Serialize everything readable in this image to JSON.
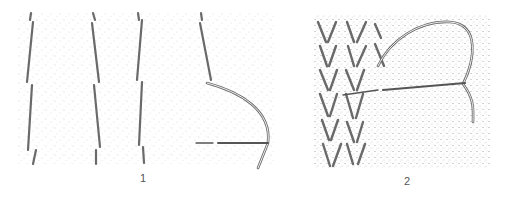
{
  "figures": [
    {
      "label": "1",
      "description": "Stockinette stitch columns with needle and thread inserted horizontally (duplicate stitch start)"
    },
    {
      "label": "2",
      "description": "V-shaped knit stitches with threaded needle passing under stitch"
    }
  ],
  "colors": {
    "stroke": "#6a6a6a",
    "stipple": "#9a9a9a",
    "background": "#ffffff"
  }
}
